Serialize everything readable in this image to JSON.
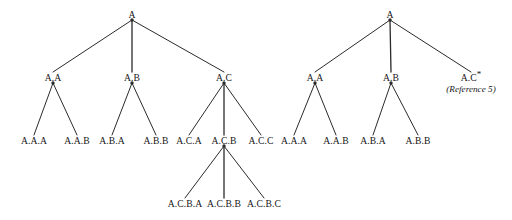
{
  "figure": {
    "type": "tree-diagram",
    "background_color": "#ffffff",
    "line_color": "#2b2b2b",
    "text_color": "#161616"
  },
  "trees": [
    {
      "id": "left-tree",
      "name": "left-hierarchy-tree",
      "root": "A",
      "nodes": [
        {
          "id": "L-A",
          "label": "A",
          "x": 132,
          "y": 14,
          "dot": true,
          "level": 0
        },
        {
          "id": "L-A.A",
          "label": "A.A",
          "x": 53,
          "y": 77,
          "dot": true,
          "level": 1
        },
        {
          "id": "L-A.B",
          "label": "A.B",
          "x": 132,
          "y": 77,
          "dot": true,
          "level": 1
        },
        {
          "id": "L-A.C",
          "label": "A.C",
          "x": 224,
          "y": 77,
          "dot": true,
          "level": 1
        },
        {
          "id": "L-A.A.A",
          "label": "A.A.A",
          "x": 34,
          "y": 140,
          "dot": false,
          "level": 2
        },
        {
          "id": "L-A.A.B",
          "label": "A.A.B",
          "x": 77,
          "y": 140,
          "dot": false,
          "level": 2
        },
        {
          "id": "L-A.B.A",
          "label": "A.B.A",
          "x": 112,
          "y": 140,
          "dot": false,
          "level": 2
        },
        {
          "id": "L-A.B.B",
          "label": "A.B.B",
          "x": 156,
          "y": 140,
          "dot": false,
          "level": 2
        },
        {
          "id": "L-A.C.A",
          "label": "A.C.A",
          "x": 189,
          "y": 140,
          "dot": false,
          "level": 2
        },
        {
          "id": "L-A.C.B",
          "label": "A.C.B",
          "x": 224,
          "y": 140,
          "dot": true,
          "level": 2
        },
        {
          "id": "L-A.C.C",
          "label": "A.C.C",
          "x": 261,
          "y": 140,
          "dot": false,
          "level": 2
        },
        {
          "id": "L-A.C.B.A",
          "label": "A.C.B.A",
          "x": 185,
          "y": 203,
          "dot": false,
          "level": 3
        },
        {
          "id": "L-A.C.B.B",
          "label": "A.C.B.B",
          "x": 224,
          "y": 203,
          "dot": false,
          "level": 3
        },
        {
          "id": "L-A.C.B.C",
          "label": "A.C.B.C",
          "x": 264,
          "y": 203,
          "dot": false,
          "level": 3
        }
      ],
      "edges": [
        {
          "from": "L-A",
          "to": "L-A.A"
        },
        {
          "from": "L-A",
          "to": "L-A.B"
        },
        {
          "from": "L-A",
          "to": "L-A.C"
        },
        {
          "from": "L-A.A",
          "to": "L-A.A.A"
        },
        {
          "from": "L-A.A",
          "to": "L-A.A.B"
        },
        {
          "from": "L-A.B",
          "to": "L-A.B.A"
        },
        {
          "from": "L-A.B",
          "to": "L-A.B.B"
        },
        {
          "from": "L-A.C",
          "to": "L-A.C.A"
        },
        {
          "from": "L-A.C",
          "to": "L-A.C.B"
        },
        {
          "from": "L-A.C",
          "to": "L-A.C.C"
        },
        {
          "from": "L-A.C.B",
          "to": "L-A.C.B.A"
        },
        {
          "from": "L-A.C.B",
          "to": "L-A.C.B.B"
        },
        {
          "from": "L-A.C.B",
          "to": "L-A.C.B.C"
        }
      ]
    },
    {
      "id": "right-tree",
      "name": "right-hierarchy-tree",
      "root": "A",
      "nodes": [
        {
          "id": "R-A",
          "label": "A",
          "x": 390,
          "y": 14,
          "dot": true,
          "level": 0
        },
        {
          "id": "R-A.A",
          "label": "A.A",
          "x": 315,
          "y": 77,
          "dot": true,
          "level": 1
        },
        {
          "id": "R-A.B",
          "label": "A.B",
          "x": 391,
          "y": 77,
          "dot": true,
          "level": 1
        },
        {
          "id": "R-A.C",
          "label": "A.C",
          "x": 471,
          "y": 77,
          "dot": false,
          "level": 1,
          "starred": true,
          "annotation": "(Reference 5)"
        },
        {
          "id": "R-A.A.A",
          "label": "A.A.A",
          "x": 294,
          "y": 140,
          "dot": false,
          "level": 2
        },
        {
          "id": "R-A.A.B",
          "label": "A.A.B",
          "x": 336,
          "y": 140,
          "dot": false,
          "level": 2
        },
        {
          "id": "R-A.B.A",
          "label": "A.B.A",
          "x": 373,
          "y": 140,
          "dot": false,
          "level": 2
        },
        {
          "id": "R-A.B.B",
          "label": "A.B.B",
          "x": 418,
          "y": 140,
          "dot": false,
          "level": 2
        }
      ],
      "edges": [
        {
          "from": "R-A",
          "to": "R-A.A"
        },
        {
          "from": "R-A",
          "to": "R-A.B"
        },
        {
          "from": "R-A",
          "to": "R-A.C"
        },
        {
          "from": "R-A.A",
          "to": "R-A.A.A"
        },
        {
          "from": "R-A.A",
          "to": "R-A.A.B"
        },
        {
          "from": "R-A.B",
          "to": "R-A.B.A"
        },
        {
          "from": "R-A.B",
          "to": "R-A.B.B"
        }
      ]
    }
  ]
}
